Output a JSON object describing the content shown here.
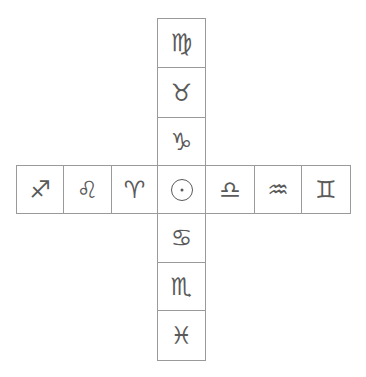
{
  "diagram": {
    "line_color": "#9a9a9a",
    "glyph_color": "#5a5a5a",
    "vertical_column": [
      {
        "name": "Virgo",
        "glyph": "♍"
      },
      {
        "name": "Taurus",
        "glyph": "♉"
      },
      {
        "name": "Capricorn",
        "glyph": "♑"
      },
      {
        "name": "Sun",
        "glyph": "☉"
      },
      {
        "name": "Cancer",
        "glyph": "♋"
      },
      {
        "name": "Scorpio",
        "glyph": "♏"
      },
      {
        "name": "Pisces",
        "glyph": "♓"
      }
    ],
    "horizontal_row": [
      {
        "name": "Sagittarius",
        "glyph": "♐"
      },
      {
        "name": "Leo",
        "glyph": "♌"
      },
      {
        "name": "Aries",
        "glyph": "♈"
      },
      {
        "name": "Sun",
        "glyph": "☉"
      },
      {
        "name": "Libra",
        "glyph": "♎"
      },
      {
        "name": "Aquarius",
        "glyph": "♒"
      },
      {
        "name": "Gemini",
        "glyph": "♊"
      }
    ]
  }
}
